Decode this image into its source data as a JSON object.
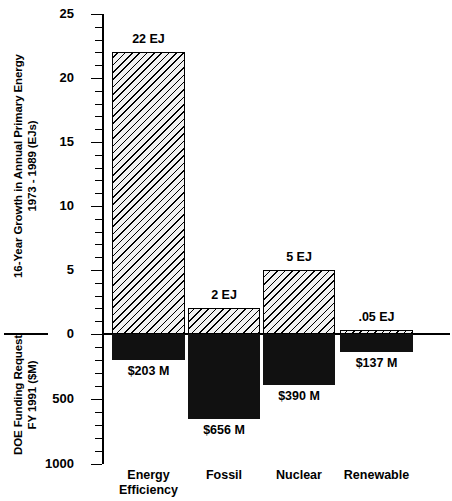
{
  "chart_data": {
    "type": "bar",
    "title": "",
    "categories": [
      "Energy Efficiency",
      "Fossil",
      "Nuclear",
      "Renewable"
    ],
    "category_lines": [
      [
        "Energy",
        "Efficiency"
      ],
      [
        "Fossil"
      ],
      [
        "Nuclear"
      ],
      [
        "Renewable"
      ]
    ],
    "series": [
      {
        "name": "16-Year Growth in Annual Primary Energy 1973 - 1989 (EJs)",
        "axis": "upper",
        "unit": "EJ",
        "values": [
          22,
          2,
          5,
          0.05
        ],
        "labels": [
          "22 EJ",
          "2 EJ",
          "5 EJ",
          ".05 EJ"
        ],
        "style": "hatched"
      },
      {
        "name": "DOE Funding Request FY 1991 ($M)",
        "axis": "lower",
        "unit": "$M",
        "values": [
          203,
          656,
          390,
          137
        ],
        "labels": [
          "$203  M",
          "$656 M",
          "$390 M",
          "$137 M"
        ],
        "style": "solid-black"
      }
    ],
    "upper_axis": {
      "label_lines": [
        "16-Year Growth in Annual Primary Energy",
        "1973 - 1989 (EJs)"
      ],
      "ylim": [
        0,
        25
      ],
      "major_ticks": [
        25,
        20,
        15,
        10,
        5,
        0
      ],
      "major_tick_labels": [
        "25",
        "20",
        "15",
        "10",
        "5",
        "0"
      ],
      "minor_tick_interval": 1
    },
    "lower_axis": {
      "label_lines": [
        "DOE Funding Request",
        "FY 1991 ($M)"
      ],
      "ylim": [
        0,
        1000
      ],
      "major_ticks": [
        500,
        1000
      ],
      "major_tick_labels": [
        "500",
        "1000"
      ],
      "minor_tick_interval": 100
    },
    "grid": false,
    "legend": "none",
    "colors": {
      "bar_negative": "#111111",
      "bar_positive_fill": "#f2f2f2",
      "hatch": "#000000",
      "axis": "#000000",
      "text": "#000000"
    }
  }
}
